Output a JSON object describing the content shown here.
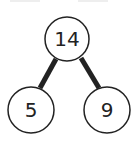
{
  "diagram": {
    "type": "number-bond",
    "whole": {
      "label": "14"
    },
    "parts": [
      {
        "label": "5"
      },
      {
        "label": "9"
      }
    ],
    "colors": {
      "stroke": "#222222",
      "fill": "#ffffff",
      "top_lines": "#eeeeee"
    }
  }
}
